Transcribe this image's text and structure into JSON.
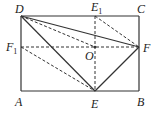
{
  "diagram": {
    "type": "geometry-figure",
    "shape": "rectangle",
    "stroke_color": "#333333",
    "points": {
      "A": {
        "label": "A",
        "x": 21,
        "y": 91
      },
      "B": {
        "label": "B",
        "x": 139,
        "y": 91
      },
      "C": {
        "label": "C",
        "x": 139,
        "y": 16
      },
      "D": {
        "label": "D",
        "x": 21,
        "y": 16
      },
      "E": {
        "label": "E",
        "x": 95,
        "y": 91
      },
      "F": {
        "label": "F",
        "x": 139,
        "y": 47
      },
      "E1": {
        "label": "E",
        "sub": "1",
        "x": 95,
        "y": 16
      },
      "F1": {
        "label": "F",
        "sub": "1",
        "x": 21,
        "y": 47
      },
      "O": {
        "label": "O",
        "x": 95,
        "y": 47
      }
    },
    "solid_segments": [
      "AB",
      "BC",
      "CD",
      "DA",
      "DE",
      "DF",
      "EF"
    ],
    "dashed_segments": [
      "E1E",
      "F1F",
      "DO",
      "E1F",
      "F1E"
    ]
  }
}
